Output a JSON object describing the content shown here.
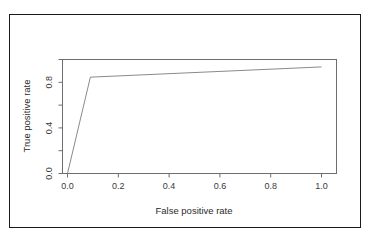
{
  "figure": {
    "has_outer_border": true,
    "border_color": "#1a1a1a",
    "background": "#ffffff"
  },
  "axes": {
    "x_title": "False positive rate",
    "y_title": "True positive rate",
    "x_tick_labels": [
      "0.0",
      "0.2",
      "0.4",
      "0.6",
      "0.8",
      "1.0"
    ],
    "x_tick_values": [
      0.0,
      0.2,
      0.4,
      0.6,
      0.8,
      1.0
    ],
    "y_tick_labels": [
      "0.0",
      "0.4",
      "0.8"
    ],
    "y_tick_values": [
      0.0,
      0.4,
      0.8
    ],
    "y_minor_tick_values": [
      0.2,
      0.6,
      1.0
    ],
    "axis_color": "#6e6e6e"
  },
  "chart_data": {
    "type": "line",
    "title": "",
    "subtitle": "",
    "xlabel": "False positive rate",
    "ylabel": "True positive rate",
    "xlim": [
      -0.03,
      1.03
    ],
    "ylim": [
      -0.03,
      1.03
    ],
    "grid": false,
    "legend": null,
    "line_color": "#8a8a8a",
    "series": [
      {
        "name": "ROC curve",
        "x": [
          0.0,
          0.09,
          1.0
        ],
        "y": [
          0.0,
          0.845,
          0.935
        ]
      }
    ],
    "annotations": []
  }
}
